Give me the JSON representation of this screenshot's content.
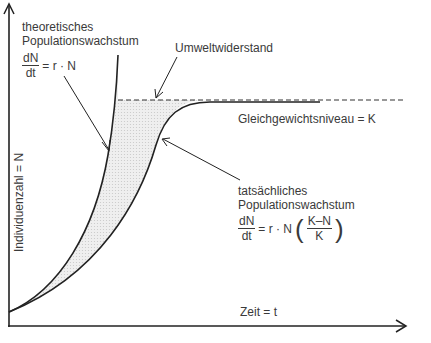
{
  "diagram": {
    "title": "Populationswachstum",
    "axes": {
      "y_label": "Individuenzahl = N",
      "x_label": "Zeit = t"
    },
    "labels": {
      "theoretical_line1": "theoretisches",
      "theoretical_line2": "Populationswachstum",
      "theoretical_formula": {
        "num": "dN",
        "den": "dt",
        "rhs": "= r · N"
      },
      "resistance": "Umweltwiderstand",
      "equilibrium": "Gleichgewichtsniveau = K",
      "actual_line1": "tatsächliches",
      "actual_line2": "Populationswachstum",
      "actual_formula": {
        "num": "dN",
        "den": "dt",
        "rhs": "= r · N",
        "inner_num": "K–N",
        "inner_den": "K"
      }
    },
    "colors": {
      "line": "#222222",
      "fill": "#e6e6e6",
      "text": "#3a3a3a"
    }
  }
}
